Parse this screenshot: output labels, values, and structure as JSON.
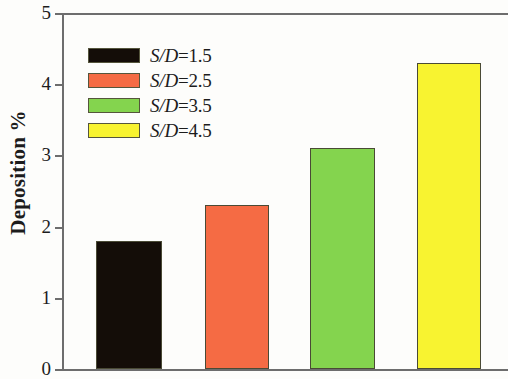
{
  "chart_data": {
    "type": "bar",
    "title": "",
    "xlabel": "",
    "ylabel": "Deposition %",
    "ylim": [
      0,
      5
    ],
    "yticks": [
      0,
      1,
      2,
      3,
      4,
      5
    ],
    "ytick_labels": [
      "0",
      "1",
      "2",
      "3",
      "4",
      "5"
    ],
    "grid": false,
    "legend_position": "upper-left-inside",
    "xtick_labels": [],
    "categories": [
      "S/D=1.5",
      "S/D=2.5",
      "S/D=3.5",
      "S/D=4.5"
    ],
    "values": [
      1.8,
      2.3,
      3.1,
      4.3
    ],
    "series": [
      {
        "name": "Deposition %",
        "values": [
          1.8,
          2.3,
          3.1,
          4.3
        ]
      }
    ],
    "bar_colors": [
      "#140d08",
      "#F56B44",
      "#84D44E",
      "#F8F330"
    ],
    "bar_edge_color": "#4a4a35",
    "axis_color": "#6d6d6d",
    "background_color": "#fdfdfb"
  },
  "axis": {
    "ylabel": "Deposition %",
    "ticks": [
      {
        "value": 5,
        "label": "5"
      },
      {
        "value": 4,
        "label": "4"
      },
      {
        "value": 3,
        "label": "3"
      },
      {
        "value": 2,
        "label": "2"
      },
      {
        "value": 1,
        "label": "1"
      },
      {
        "value": 0,
        "label": "0"
      }
    ]
  },
  "legend": {
    "items": [
      {
        "symbol": "S/D",
        "value": "=1.5",
        "color": "#140d08"
      },
      {
        "symbol": "S/D",
        "value": "=2.5",
        "color": "#F56B44"
      },
      {
        "symbol": "S/D",
        "value": "=3.5",
        "color": "#84D44E"
      },
      {
        "symbol": "S/D",
        "value": "=4.5",
        "color": "#F8F330"
      }
    ]
  },
  "bars": [
    {
      "label": "S/D=1.5",
      "value": 1.8,
      "color": "#140d08",
      "left_px": 34,
      "width_px": 66
    },
    {
      "label": "S/D=2.5",
      "value": 2.3,
      "color": "#F56B44",
      "left_px": 143,
      "width_px": 64
    },
    {
      "label": "S/D=3.5",
      "value": 3.1,
      "color": "#84D44E",
      "left_px": 248,
      "width_px": 65
    },
    {
      "label": "S/D=4.5",
      "value": 4.3,
      "color": "#F8F330",
      "left_px": 355,
      "width_px": 64
    }
  ]
}
